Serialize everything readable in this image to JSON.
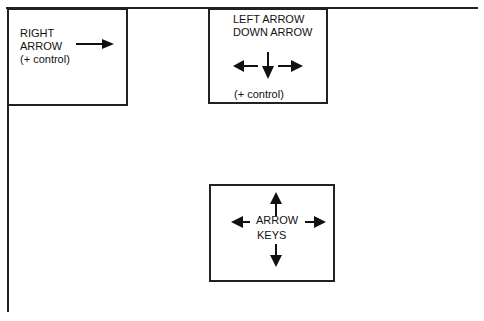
{
  "diagram": {
    "left_box": {
      "lines": [
        "RIGHT",
        "ARROW",
        "(+ control)"
      ],
      "arrow": "right-arrow"
    },
    "middle_box": {
      "lines": [
        "LEFT ARROW",
        "DOWN ARROW"
      ],
      "note": "(+ control)",
      "arrows": [
        "left-arrow",
        "down-arrow",
        "right-arrow"
      ]
    },
    "bottom_box": {
      "lines": [
        "ARROW",
        "KEYS"
      ],
      "arrows": [
        "up-arrow",
        "left-arrow",
        "right-arrow",
        "down-arrow"
      ]
    },
    "colors": {
      "stroke": "#222222",
      "background": "#ffffff"
    }
  }
}
